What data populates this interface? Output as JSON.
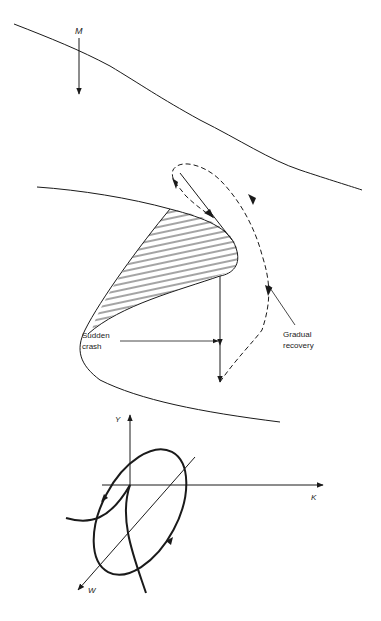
{
  "figure": {
    "labels": {
      "m_axis": "M",
      "sudden_crash_line1": "Sudden",
      "sudden_crash_line2": "crash",
      "gradual_recovery_line1": "Gradual",
      "gradual_recovery_line2": "recovery",
      "y_axis": "Y",
      "k_axis": "K",
      "w_axis": "W"
    },
    "colors": {
      "ink": "#1a1a1a",
      "background": "#ffffff"
    }
  }
}
